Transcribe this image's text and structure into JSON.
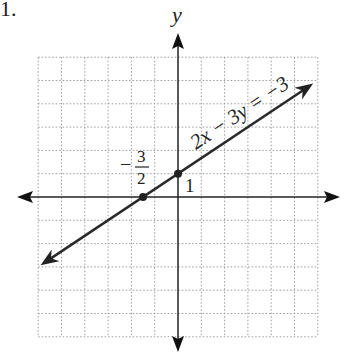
{
  "problem_number": "1.",
  "chart_data": {
    "type": "line",
    "title": "",
    "xlabel": "",
    "ylabel": "y",
    "xlim": [
      -6,
      6
    ],
    "ylim": [
      -6,
      6
    ],
    "grid": true,
    "equation": "2x − 3y = −3",
    "series": [
      {
        "name": "2x - 3y = -3",
        "slope": 0.6667,
        "intercept": 1,
        "x_range": [
          -5.9,
          5.8
        ]
      }
    ],
    "points": [
      {
        "x": -1.5,
        "y": 0,
        "label": "−3/2"
      },
      {
        "x": 0,
        "y": 1,
        "label": "1"
      }
    ],
    "annotations": {
      "x_intercept_num": "3",
      "x_intercept_den": "2",
      "x_intercept_sign": "−",
      "y_intercept": "1"
    }
  }
}
